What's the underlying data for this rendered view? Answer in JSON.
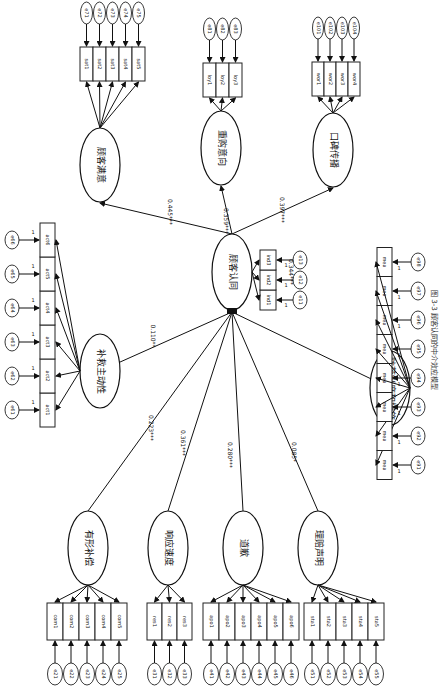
{
  "diagram": {
    "caption": "图 3-3  顾客认同的中介效应模型",
    "central": {
      "label": "顾客认同",
      "indicators": [
        "ind1",
        "ind2",
        "ind3"
      ],
      "errors": [
        "e11",
        "e12",
        "e13"
      ]
    },
    "outcomes": [
      {
        "label": "顾客满意",
        "indicators": [
          "sat1",
          "sat2",
          "sat3",
          "sat4",
          "sat5"
        ],
        "errors": [
          "e71",
          "e72",
          "e73",
          "e74",
          "e75"
        ],
        "coef": "0.445***"
      },
      {
        "label": "重购意向",
        "indicators": [
          "loy1",
          "loy2",
          "loy3"
        ],
        "errors": [
          "e81",
          "e82",
          "e83"
        ],
        "coef": "0.359***"
      },
      {
        "label": "口碑传播",
        "indicators": [
          "wor1",
          "wor2",
          "wor3",
          "wor4"
        ],
        "errors": [
          "e101",
          "e102",
          "e103",
          "e104"
        ],
        "coef": "0.397***"
      }
    ],
    "predictors": [
      {
        "label": "补救主动性",
        "indicators": [
          "act1",
          "act2",
          "act3",
          "act4",
          "act5",
          "act6"
        ],
        "errors": [
          "e61",
          "e62",
          "e63",
          "e64",
          "e65",
          "e66"
        ],
        "coef": "0.110**"
      },
      {
        "label": "有形补偿",
        "indicators": [
          "com1",
          "com2",
          "com3",
          "com4",
          "com5"
        ],
        "errors": [
          "e21",
          "e22",
          "e23",
          "e24",
          "e25"
        ],
        "coef": "0.223***"
      },
      {
        "label": "响应速度",
        "indicators": [
          "res1",
          "res2",
          "res3"
        ],
        "errors": [
          "e31",
          "e32",
          "e33"
        ],
        "coef": "0.361***"
      },
      {
        "label": "道歉",
        "indicators": [
          "apo1",
          "apo2",
          "apo3",
          "apo4",
          "apo5",
          "apo6"
        ],
        "errors": [
          "e41",
          "e42",
          "e43",
          "e44",
          "e45",
          "e46"
        ],
        "coef": "0.280***"
      },
      {
        "label": "理赔声明",
        "indicators": [
          "sta1",
          "sta2",
          "sta3",
          "sta4",
          "sta5"
        ],
        "errors": [
          "e51",
          "e52",
          "e53",
          "e54",
          "e55"
        ],
        "coef": "0.085*"
      },
      {
        "label": "防范制度和措施",
        "indicators": [
          "mea",
          "mea",
          "mea",
          "mea",
          "mea",
          "mea",
          "mea",
          "mea"
        ],
        "errors": [
          "e91",
          "e92",
          "e93",
          "e94",
          "e95",
          "e96",
          "e97",
          "e98"
        ],
        "coef": "0.344***"
      }
    ],
    "fixed_loading": "1"
  }
}
